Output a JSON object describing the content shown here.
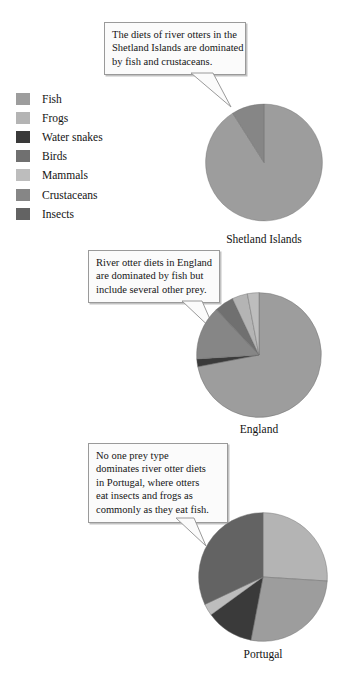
{
  "legend": {
    "title": "Prey legend",
    "items": [
      {
        "label": "Fish",
        "color": "#9d9d9d"
      },
      {
        "label": "Frogs",
        "color": "#b4b4b4"
      },
      {
        "label": "Water snakes",
        "color": "#3a3a3a"
      },
      {
        "label": "Birds",
        "color": "#707070"
      },
      {
        "label": "Mammals",
        "color": "#bdbdbd"
      },
      {
        "label": "Crustaceans",
        "color": "#868686"
      },
      {
        "label": "Insects",
        "color": "#636363"
      }
    ]
  },
  "callouts": [
    {
      "id": "callout-shetland",
      "lines": [
        "The diets of river otters in the",
        "Shetland Islands are dominated",
        "by fish and crustaceans."
      ]
    },
    {
      "id": "callout-england",
      "lines": [
        "River otter diets in England",
        "are dominated by fish but",
        "include several other prey."
      ]
    },
    {
      "id": "callout-portugal",
      "lines": [
        "No one prey type",
        "dominates river otter diets",
        "in Portugal, where otters",
        "eat insects and frogs as",
        "commonly as they eat fish."
      ]
    }
  ],
  "chart_data": [
    {
      "type": "pie",
      "title": "Shetland Islands",
      "labels": [
        "Fish",
        "Crustaceans"
      ],
      "values": [
        91,
        9
      ],
      "colors": [
        "#9d9d9d",
        "#868686"
      ],
      "start_angle": 0,
      "legend": "external"
    },
    {
      "type": "pie",
      "title": "England",
      "labels": [
        "Fish",
        "Water snakes",
        "Crustaceans",
        "Birds",
        "Frogs",
        "Mammals"
      ],
      "values": [
        72,
        2,
        14,
        5,
        4,
        3
      ],
      "colors": [
        "#9d9d9d",
        "#3a3a3a",
        "#868686",
        "#707070",
        "#b4b4b4",
        "#bdbdbd"
      ],
      "start_angle": 0,
      "legend": "external"
    },
    {
      "type": "pie",
      "title": "Portugal",
      "labels": [
        "Frogs",
        "Fish",
        "Water snakes",
        "Mammals",
        "Insects"
      ],
      "values": [
        26,
        27,
        12,
        3,
        32
      ],
      "colors": [
        "#b4b4b4",
        "#9d9d9d",
        "#3a3a3a",
        "#bdbdbd",
        "#636363"
      ],
      "start_angle": 0,
      "legend": "external"
    }
  ]
}
